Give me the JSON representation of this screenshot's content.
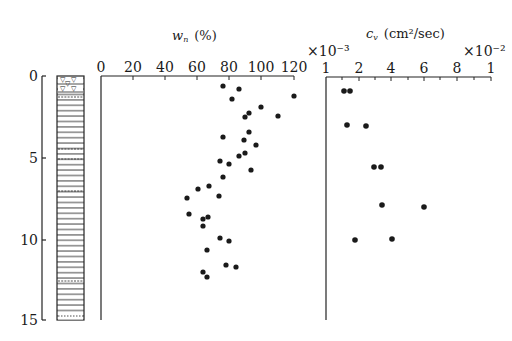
{
  "chart_data": [
    {
      "type": "scatter",
      "title": "w_n (%)",
      "xlabel": "w_n (%)",
      "ylabel": "Depth (m)",
      "xlim": [
        0,
        120
      ],
      "ylim": [
        15,
        0
      ],
      "x_ticks": [
        0,
        20,
        40,
        60,
        80,
        100,
        120
      ],
      "y_ticks": [
        0,
        5,
        10,
        15
      ],
      "grid": false,
      "points": [
        {
          "x": 76,
          "y": 0.6
        },
        {
          "x": 86,
          "y": 0.8
        },
        {
          "x": 82,
          "y": 1.4
        },
        {
          "x": 120,
          "y": 1.2
        },
        {
          "x": 100,
          "y": 1.9
        },
        {
          "x": 92,
          "y": 2.3
        },
        {
          "x": 90,
          "y": 2.5
        },
        {
          "x": 111,
          "y": 2.5
        },
        {
          "x": 92,
          "y": 3.5
        },
        {
          "x": 76,
          "y": 3.8
        },
        {
          "x": 89,
          "y": 4.0
        },
        {
          "x": 97,
          "y": 4.3
        },
        {
          "x": 90,
          "y": 4.8
        },
        {
          "x": 86,
          "y": 4.9
        },
        {
          "x": 74,
          "y": 5.2
        },
        {
          "x": 80,
          "y": 5.4
        },
        {
          "x": 94,
          "y": 5.8
        },
        {
          "x": 76,
          "y": 6.2
        },
        {
          "x": 68,
          "y": 6.8
        },
        {
          "x": 61,
          "y": 7.0
        },
        {
          "x": 74,
          "y": 7.4
        },
        {
          "x": 54,
          "y": 7.5
        },
        {
          "x": 55,
          "y": 8.5
        },
        {
          "x": 67,
          "y": 8.7
        },
        {
          "x": 64,
          "y": 8.8
        },
        {
          "x": 64,
          "y": 9.3
        },
        {
          "x": 74,
          "y": 10.0
        },
        {
          "x": 80,
          "y": 10.2
        },
        {
          "x": 66,
          "y": 10.7
        },
        {
          "x": 78,
          "y": 11.7
        },
        {
          "x": 84,
          "y": 11.8
        },
        {
          "x": 64,
          "y": 12.1
        },
        {
          "x": 66,
          "y": 12.4
        }
      ]
    },
    {
      "type": "scatter",
      "title": "c_v (cm²/sec)",
      "xlabel": "c_v (cm²/sec)",
      "ylabel": "Depth (m)",
      "xlim": [
        0.001,
        0.01
      ],
      "x_tick_labels": [
        "1",
        "2",
        "4",
        "6",
        "8",
        "1"
      ],
      "x_multiplier_left": "×10⁻³",
      "x_multiplier_right": "×10⁻²",
      "ylim": [
        15,
        0
      ],
      "grid": false,
      "points": [
        {
          "x": 0.0015,
          "y": 0.9
        },
        {
          "x": 0.0017,
          "y": 0.9
        },
        {
          "x": 0.0016,
          "y": 3.0
        },
        {
          "x": 0.0024,
          "y": 3.0
        },
        {
          "x": 0.0029,
          "y": 5.6
        },
        {
          "x": 0.0033,
          "y": 5.6
        },
        {
          "x": 0.0034,
          "y": 7.9
        },
        {
          "x": 0.0059,
          "y": 8.0
        },
        {
          "x": 0.0019,
          "y": 10.0
        },
        {
          "x": 0.004,
          "y": 10.0
        }
      ]
    }
  ],
  "labels": {
    "wn_title": "w",
    "wn_sub": "n",
    "wn_unit": "(%)",
    "cv_title": "c",
    "cv_sub": "v",
    "cv_unit": "(cm²/sec)",
    "mult_left": "×10⁻³",
    "mult_right": "×10⁻²",
    "depth_ticks": [
      "0",
      "5",
      "10",
      "15"
    ],
    "wn_ticks": [
      "0",
      "20",
      "40",
      "60",
      "80",
      "100",
      "120"
    ],
    "cv_ticks": [
      "1",
      "2",
      "4",
      "6",
      "8",
      "1"
    ]
  },
  "pixel_points": {
    "wn": [
      [
        223,
        86
      ],
      [
        239,
        89
      ],
      [
        232,
        99
      ],
      [
        294,
        96
      ],
      [
        261,
        107
      ],
      [
        249,
        113
      ],
      [
        245,
        117
      ],
      [
        278,
        116
      ],
      [
        249,
        132
      ],
      [
        223,
        137
      ],
      [
        244,
        140
      ],
      [
        256,
        145
      ],
      [
        245,
        153
      ],
      [
        239,
        156
      ],
      [
        220,
        161
      ],
      [
        229,
        164
      ],
      [
        251,
        170
      ],
      [
        223,
        177
      ],
      [
        209,
        186
      ],
      [
        198,
        189
      ],
      [
        219,
        196
      ],
      [
        187,
        198
      ],
      [
        189,
        214
      ],
      [
        208,
        217
      ],
      [
        203,
        219
      ],
      [
        203,
        226
      ],
      [
        220,
        238
      ],
      [
        229,
        241
      ],
      [
        207,
        250
      ],
      [
        226,
        265
      ],
      [
        236,
        267
      ],
      [
        203,
        272
      ],
      [
        207,
        277
      ]
    ],
    "cv": [
      [
        344,
        91
      ],
      [
        350,
        91
      ],
      [
        347,
        125
      ],
      [
        366,
        126
      ],
      [
        374,
        167
      ],
      [
        381,
        167
      ],
      [
        382,
        205
      ],
      [
        424,
        207
      ],
      [
        355,
        240
      ],
      [
        392,
        239
      ]
    ]
  }
}
